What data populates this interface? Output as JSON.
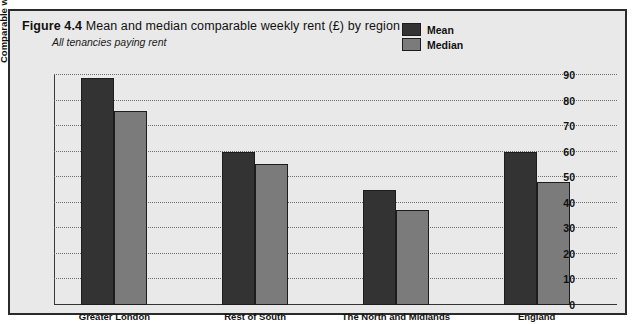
{
  "figure": {
    "number": "Figure 4.4",
    "title": "Mean and median comparable weekly rent (£) by region",
    "subtitle": "All tenancies paying rent"
  },
  "legend": {
    "mean_label": "Mean",
    "median_label": "Median"
  },
  "colors": {
    "mean": "#333333",
    "median": "#7b7b7b",
    "panel_background": "#e9e9e9",
    "frame_border": "#2b2b2b",
    "gridline": "#6d6d6d"
  },
  "chart_data": {
    "type": "bar",
    "title": "Mean and median comparable weekly rent (£) by region",
    "subtitle": "All tenancies paying rent",
    "xlabel": "",
    "ylabel": "Comparable weekly rent (£)",
    "ylim": [
      0,
      90
    ],
    "ytick_step": 10,
    "yticks": [
      0,
      10,
      20,
      30,
      40,
      50,
      60,
      70,
      80,
      90
    ],
    "ytick_labels": [
      "0",
      "10",
      "20",
      "30",
      "40",
      "50",
      "60",
      "70",
      "80",
      "90"
    ],
    "grid": "horizontal-dotted",
    "legend_position": "top-right",
    "categories": [
      "Greater London",
      "Rest of South",
      "The North and Midlands",
      "England"
    ],
    "series": [
      {
        "name": "Mean",
        "values": [
          89,
          60,
          45,
          60
        ]
      },
      {
        "name": "Median",
        "values": [
          76,
          55,
          37,
          48
        ]
      }
    ]
  }
}
